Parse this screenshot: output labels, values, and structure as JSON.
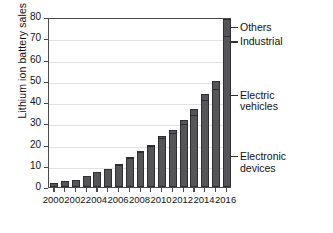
{
  "chart_data": {
    "type": "bar",
    "title": "",
    "xlabel": "",
    "ylabel": "Lithium ion battery sales / GWh",
    "ylim": [
      0,
      80
    ],
    "ytick_step": 10,
    "yticks": [
      0,
      10,
      20,
      30,
      40,
      50,
      60,
      70,
      80
    ],
    "grid": true,
    "legend_position": "right-annotations",
    "stacked": true,
    "categories": [
      2000,
      2001,
      2002,
      2003,
      2004,
      2005,
      2006,
      2007,
      2008,
      2009,
      2010,
      2011,
      2012,
      2013,
      2014,
      2015,
      2016
    ],
    "xtick_labels": [
      "2000",
      "2002",
      "2004",
      "2006",
      "2008",
      "2010",
      "2012",
      "2014",
      "2016"
    ],
    "xtick_values": [
      2000,
      2002,
      2004,
      2006,
      2008,
      2010,
      2012,
      2014,
      2016
    ],
    "values": [
      2,
      3,
      3.5,
      5,
      7,
      8.5,
      11,
      14,
      17,
      20,
      24,
      27,
      31.5,
      36.5,
      44,
      50,
      79
    ],
    "series": [
      {
        "name": "Electronic devices",
        "values": [
          2,
          3,
          3.5,
          5,
          7,
          8.5,
          10.5,
          13,
          15.5,
          17.5,
          19.5,
          20.5,
          22,
          23.5,
          26,
          27,
          31
        ]
      },
      {
        "name": "Electric vehicles",
        "values": [
          0,
          0,
          0,
          0,
          0,
          0,
          0.3,
          0.7,
          1.2,
          2,
          3.5,
          5,
          7.5,
          10.5,
          15,
          19,
          40
        ]
      },
      {
        "name": "Industrial",
        "values": [
          0,
          0,
          0,
          0,
          0,
          0,
          0.2,
          0.3,
          0.3,
          0.5,
          1,
          1.5,
          2,
          2.5,
          3,
          4,
          8
        ]
      },
      {
        "name": "Others",
        "values": [
          0,
          0,
          0,
          0,
          0,
          0,
          0,
          0,
          0,
          0,
          0,
          0,
          0,
          0,
          0,
          0,
          0
        ]
      }
    ],
    "annotations": [
      {
        "label": "Others",
        "y": 76
      },
      {
        "label": "Industrial",
        "y": 69
      },
      {
        "label": "Electric\nvehicles",
        "y": 44
      },
      {
        "label": "Electronic\ndevices",
        "y": 15
      }
    ],
    "colors": {
      "bar_fill": "#555557",
      "bar_edge": "#2f2f31",
      "grid": "#e2e2e2",
      "axis": "#4a4a4a",
      "text": "#111111",
      "background": "#ffffff"
    }
  }
}
